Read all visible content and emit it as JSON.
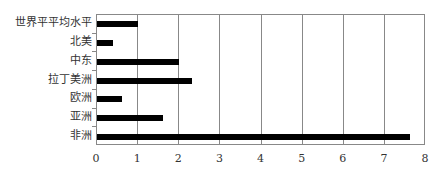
{
  "chart_data": {
    "type": "bar",
    "orientation": "horizontal",
    "title": "",
    "xlabel": "",
    "ylabel": "",
    "categories": [
      "世界平平均水平",
      "北美",
      "中东",
      "拉丁美洲",
      "欧洲",
      "亚洲",
      "非洲"
    ],
    "values": [
      1.0,
      0.4,
      2.0,
      2.3,
      0.6,
      1.6,
      7.6
    ],
    "xlim": [
      0,
      8
    ],
    "xticks": [
      "0",
      "1",
      "2",
      "3",
      "4",
      "5",
      "6",
      "7",
      "8"
    ],
    "grid": "vertical",
    "legend": null,
    "bar_color": "#000000",
    "grid_color": "#888888"
  }
}
